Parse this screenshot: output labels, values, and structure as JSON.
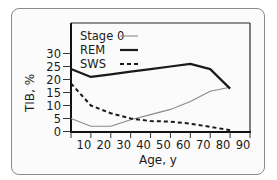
{
  "chart_data": {
    "type": "line",
    "title": "",
    "xlabel": "Age, y",
    "ylabel": "TIB, %",
    "xlim": [
      0,
      90
    ],
    "ylim": [
      0,
      30
    ],
    "x_ticks": [
      10,
      20,
      30,
      40,
      50,
      60,
      70,
      80,
      90
    ],
    "y_ticks": [
      0,
      5,
      10,
      15,
      20,
      25,
      30
    ],
    "grid": false,
    "legend_position": "top-left inside plot",
    "series": [
      {
        "name": "Stage 0",
        "style": "thin-solid",
        "color": "#8a8a8a",
        "x": [
          0,
          10,
          20,
          30,
          40,
          50,
          60,
          70,
          80
        ],
        "y": [
          5,
          2,
          2,
          4.5,
          6.5,
          8.5,
          11.5,
          15.5,
          17
        ]
      },
      {
        "name": "REM",
        "style": "thick-solid",
        "color": "#1a1a1a",
        "x": [
          0,
          10,
          20,
          30,
          40,
          50,
          60,
          70,
          80
        ],
        "y": [
          24,
          21,
          22,
          23,
          24,
          25,
          26,
          24,
          16.5
        ]
      },
      {
        "name": "SWS",
        "style": "dashed",
        "color": "#1a1a1a",
        "x": [
          0,
          10,
          20,
          30,
          40,
          50,
          60,
          70,
          80
        ],
        "y": [
          18.5,
          10,
          7,
          5,
          4,
          3.8,
          3,
          1.8,
          0.5
        ]
      }
    ]
  },
  "legend": {
    "items": [
      {
        "label": "Stage 0"
      },
      {
        "label": "REM"
      },
      {
        "label": "SWS"
      }
    ]
  },
  "axes": {
    "x_title": "Age, y",
    "y_title": "TIB, %"
  }
}
